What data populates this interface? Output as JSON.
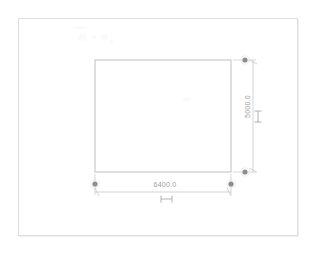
{
  "app": {
    "title": "CAD Dimension View",
    "background_color": "#ffffff",
    "line_color": "#b9b9b9",
    "frame_color": "#dedede",
    "text_color": "#9d9d9d",
    "grip_color": "#8e8e8e"
  },
  "drawing": {
    "shape_name": "rectangle",
    "frame": {
      "x": 18,
      "y": 18,
      "width": 280,
      "height": 218
    },
    "rectangle": {
      "x": 95,
      "y": 60,
      "width": 136,
      "height": 112
    }
  },
  "dimensions": {
    "horizontal": {
      "label": "6400.0",
      "orientation": "horizontal",
      "line_y": 192,
      "start_x": 95,
      "end_x": 231,
      "grip_y": 184,
      "handle_glyph": "dimension-handle-icon"
    },
    "vertical": {
      "label": "5000.0",
      "orientation": "vertical",
      "line_x": 253,
      "start_y": 60,
      "end_y": 172,
      "grip_x": 245,
      "handle_glyph": "dimension-handle-icon"
    }
  },
  "grips": [
    {
      "name": "grip-top-right",
      "x": 245,
      "y": 60
    },
    {
      "name": "grip-bottom-right",
      "x": 245,
      "y": 172
    },
    {
      "name": "grip-bottom-left",
      "x": 95,
      "y": 184
    },
    {
      "name": "grip-bottom-right-horizontal",
      "x": 231,
      "y": 184
    }
  ]
}
